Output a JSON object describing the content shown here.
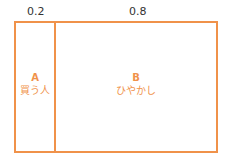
{
  "diagram": {
    "accent_color": "#F0924A",
    "regions": [
      {
        "ratio": "0.2",
        "key": "A",
        "label": "買う人"
      },
      {
        "ratio": "0.8",
        "key": "B",
        "label": "ひやかし"
      }
    ]
  }
}
